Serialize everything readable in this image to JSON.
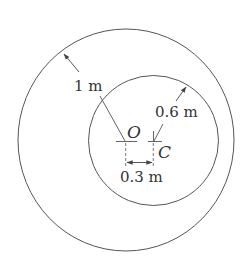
{
  "diagram": {
    "outer_circle": {
      "center": "O",
      "radius_label": "1 m"
    },
    "inner_circle": {
      "center": "C",
      "radius_label": "0.6 m"
    },
    "points": {
      "O": "O",
      "C": "C"
    },
    "offset_label": "0.3 m",
    "line_color": "#555555"
  }
}
